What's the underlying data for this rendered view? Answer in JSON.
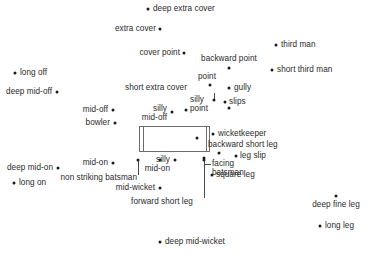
{
  "diagram": {
    "width": 366,
    "height": 255,
    "background_color": "#ffffff",
    "dot_color": "#1c1c1c",
    "text_color": "#2b2b2b",
    "line_color": "#6d6d6d"
  },
  "pitch": {
    "name": "cricket-pitch",
    "x": 139,
    "y": 126,
    "width": 71,
    "height": 26,
    "bowler_end_crease_x": 143,
    "batsman_end_crease_x": 206
  },
  "positions": [
    {
      "label": "deep extra cover",
      "align": "left",
      "text_x": 153,
      "text_y": 9,
      "dot_x": 148,
      "dot_y": 9
    },
    {
      "label": "extra cover",
      "align": "right",
      "text_x": 156,
      "text_y": 29,
      "dot_x": 160,
      "dot_y": 29
    },
    {
      "label": "third man",
      "align": "left",
      "text_x": 281,
      "text_y": 45,
      "dot_x": 276,
      "dot_y": 45
    },
    {
      "label": "cover point",
      "align": "right",
      "text_x": 180,
      "text_y": 53,
      "dot_x": 184,
      "dot_y": 53
    },
    {
      "label": "backward point",
      "align": "center",
      "text_x": 229,
      "text_y": 59,
      "dot_x": 229,
      "dot_y": 68
    },
    {
      "label": "short third man",
      "align": "left",
      "text_x": 277,
      "text_y": 70,
      "dot_x": 272,
      "dot_y": 70
    },
    {
      "label": "long off",
      "align": "left",
      "text_x": 20,
      "text_y": 73,
      "dot_x": 15,
      "dot_y": 73
    },
    {
      "label": "point",
      "align": "center",
      "text_x": 207,
      "text_y": 77,
      "dot_x": 210,
      "dot_y": 85
    },
    {
      "label": "short extra cover",
      "align": "center",
      "text_x": 156,
      "text_y": 88,
      "dot_x": 214,
      "dot_y": 100
    },
    {
      "label": "gully",
      "align": "left",
      "text_x": 234,
      "text_y": 88,
      "dot_x": 229,
      "dot_y": 88
    },
    {
      "label": "deep mid-off",
      "align": "right",
      "text_x": 52,
      "text_y": 92,
      "dot_x": 57,
      "dot_y": 92
    },
    {
      "label": "slips",
      "align": "left",
      "text_x": 229,
      "text_y": 102,
      "dot_x": 225,
      "dot_y": 102
    },
    {
      "label": "slips-lower",
      "align": "left",
      "text_x": 0,
      "text_y": 0,
      "dot_x": 229,
      "dot_y": 108,
      "dot_only": true
    },
    {
      "label": "silly\npoint",
      "align": "left",
      "text_x": 190,
      "text_y": 104,
      "dot_x": 186,
      "dot_y": 110
    },
    {
      "label": "mid-off",
      "align": "right",
      "text_x": 108,
      "text_y": 110,
      "dot_x": 113,
      "dot_y": 110
    },
    {
      "label": "silly\nmid-off",
      "align": "right",
      "text_x": 167,
      "text_y": 113,
      "dot_x": 172,
      "dot_y": 112
    },
    {
      "label": "bowler",
      "align": "right",
      "text_x": 110,
      "text_y": 123,
      "dot_x": 115,
      "dot_y": 123
    },
    {
      "label": "wicketkeeper",
      "align": "left",
      "text_x": 218,
      "text_y": 134,
      "dot_x": 213,
      "dot_y": 134
    },
    {
      "label": "pitch-dot-right",
      "align": "left",
      "text_x": 0,
      "text_y": 0,
      "dot_x": 197,
      "dot_y": 138,
      "dot_only": true
    },
    {
      "label": "backward short leg",
      "align": "left",
      "text_x": 208,
      "text_y": 145,
      "dot_x": 219,
      "dot_y": 153
    },
    {
      "label": "leg slip",
      "align": "left",
      "text_x": 240,
      "text_y": 156,
      "dot_x": 236,
      "dot_y": 156
    },
    {
      "label": "deep mid-on",
      "align": "right",
      "text_x": 53,
      "text_y": 168,
      "dot_x": 58,
      "dot_y": 168
    },
    {
      "label": "mid-on",
      "align": "right",
      "text_x": 108,
      "text_y": 163,
      "dot_x": 113,
      "dot_y": 163
    },
    {
      "label": "silly\nmid-on",
      "align": "right",
      "text_x": 170,
      "text_y": 164,
      "dot_x": 175,
      "dot_y": 160
    },
    {
      "label": "facing\nbatsman",
      "align": "left",
      "text_x": 212,
      "text_y": 168,
      "dot_x": 204,
      "dot_y": 158
    },
    {
      "label": "non striking batsman",
      "align": "right",
      "text_x": 137,
      "text_y": 178,
      "dot_x": 138,
      "dot_y": 160
    },
    {
      "label": "leg slip-2",
      "align": "left",
      "text_x": 0,
      "text_y": 0,
      "dot_x": 160,
      "dot_y": 160,
      "dot_only": true
    },
    {
      "label": "long on",
      "align": "left",
      "text_x": 19,
      "text_y": 183,
      "dot_x": 14,
      "dot_y": 183
    },
    {
      "label": "square leg",
      "align": "left",
      "text_x": 216,
      "text_y": 175,
      "dot_x": 212,
      "dot_y": 175
    },
    {
      "label": "mid-wicket",
      "align": "right",
      "text_x": 155,
      "text_y": 188,
      "dot_x": 160,
      "dot_y": 188
    },
    {
      "label": "deep fine leg",
      "align": "center",
      "text_x": 336,
      "text_y": 205,
      "dot_x": 336,
      "dot_y": 196
    },
    {
      "label": "forward short leg",
      "align": "center",
      "text_x": 162,
      "text_y": 202,
      "dot_x": 204,
      "dot_y": 160
    },
    {
      "label": "long leg",
      "align": "left",
      "text_x": 325,
      "text_y": 226,
      "dot_x": 320,
      "dot_y": 226
    },
    {
      "label": "deep mid-wicket",
      "align": "left",
      "text_x": 165,
      "text_y": 242,
      "dot_x": 160,
      "dot_y": 242
    }
  ],
  "leaders": [
    {
      "name": "short-extra-cover-leader",
      "type": "v",
      "x": 214,
      "y1": 93,
      "y2": 100
    },
    {
      "name": "non-striking-batsman-leader",
      "type": "v",
      "x": 138,
      "y1": 160,
      "y2": 175
    },
    {
      "name": "facing-batsman-leader-v",
      "type": "v",
      "x": 204,
      "y1": 158,
      "y2": 164
    },
    {
      "name": "facing-batsman-leader-h",
      "type": "h",
      "x1": 204,
      "x2": 211,
      "y": 164
    },
    {
      "name": "forward-short-leg-leader",
      "type": "v",
      "x": 204,
      "y1": 164,
      "y2": 198
    }
  ]
}
